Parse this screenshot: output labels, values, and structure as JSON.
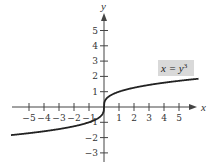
{
  "chart_data": {
    "type": "line",
    "title": "",
    "xlabel": "x",
    "ylabel": "y",
    "xlim": [
      -6,
      6.2
    ],
    "ylim": [
      -3.5,
      6
    ],
    "x_ticks": [
      -5,
      -4,
      -3,
      -2,
      -1,
      1,
      2,
      3,
      4,
      5
    ],
    "y_ticks": [
      -3,
      -2,
      -1,
      1,
      2,
      3,
      4,
      5
    ],
    "x_tick_labels": [
      "−5",
      "−4",
      "−3",
      "−2",
      "−1",
      "1",
      "2",
      "3",
      "4",
      "5"
    ],
    "y_tick_labels": [
      "−3",
      "−2",
      "−1",
      "1",
      "2",
      "3",
      "4",
      "5"
    ],
    "grid": false,
    "series": [
      {
        "name": "x = y^3",
        "function": "y = cbrt(x)",
        "x": [
          -6,
          -5,
          -4,
          -3,
          -2,
          -1,
          -0.5,
          0,
          0.5,
          1,
          2,
          3,
          4,
          5,
          6
        ],
        "values": [
          -1.82,
          -1.71,
          -1.59,
          -1.44,
          -1.26,
          -1.0,
          -0.79,
          0,
          0.79,
          1.0,
          1.26,
          1.44,
          1.59,
          1.71,
          1.82
        ]
      }
    ],
    "annotations": [
      {
        "text": "x = y^3",
        "x": 4.8,
        "y": 2.35,
        "boxed": true,
        "box_color": "#d9d9d9"
      }
    ],
    "colors": {
      "curve": "#222222",
      "axes": "#444444",
      "label_box": "#d9d9d9"
    }
  },
  "labels": {
    "x_axis": "x",
    "y_axis": "y",
    "equation_base": "x = y",
    "equation_exp": "3"
  }
}
